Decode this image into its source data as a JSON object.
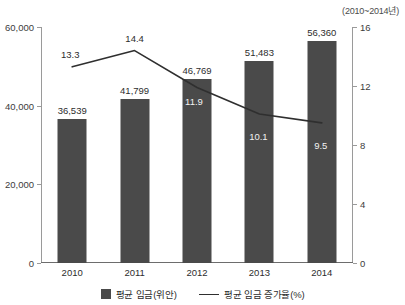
{
  "annotation": {
    "period": "(2010~2014년)"
  },
  "legend": {
    "items": [
      {
        "label": "평균 임금(위안)",
        "marker": "bar-swatch",
        "color": "#4a4a4a"
      },
      {
        "label": "평균 임금 증가율(%)",
        "marker": "line-swatch",
        "color": "#2f2f2f"
      }
    ]
  },
  "chart_data": {
    "type": "bar",
    "title": "",
    "subtitle": "",
    "xlabel": "",
    "ylabel": "",
    "grid": false,
    "legend_position": "bottom",
    "categories": [
      "2010",
      "2011",
      "2012",
      "2013",
      "2014"
    ],
    "series": [
      {
        "name": "평균 임금(위안)",
        "type": "bar",
        "axis": "left",
        "color": "#4a4a4a",
        "values": [
          36539,
          41799,
          46769,
          51483,
          56360
        ],
        "labels": [
          "36,539",
          "41,799",
          "46,769",
          "51,483",
          "56,360"
        ],
        "label_color": "#2d2d2d"
      },
      {
        "name": "평균 임금 증가율(%)",
        "type": "line",
        "axis": "right",
        "color": "#2f2f2f",
        "values": [
          13.3,
          14.4,
          11.9,
          10.1,
          9.5
        ],
        "labels": [
          "13.3",
          "14.4",
          "11.9",
          "10.1",
          "9.5"
        ],
        "label_styles": [
          "dark",
          "dark",
          "light",
          "light",
          "light"
        ]
      }
    ],
    "axes": {
      "left": {
        "ylim": [
          0,
          60000
        ],
        "ticks": [
          0,
          20000,
          40000,
          60000
        ],
        "tick_labels": [
          "0",
          "20,000",
          "40,000",
          "60,000"
        ]
      },
      "right": {
        "ylim": [
          0,
          16
        ],
        "ticks": [
          0,
          4,
          8,
          12,
          16
        ],
        "tick_labels": [
          "0",
          "4",
          "8",
          "12",
          "16"
        ]
      }
    }
  }
}
